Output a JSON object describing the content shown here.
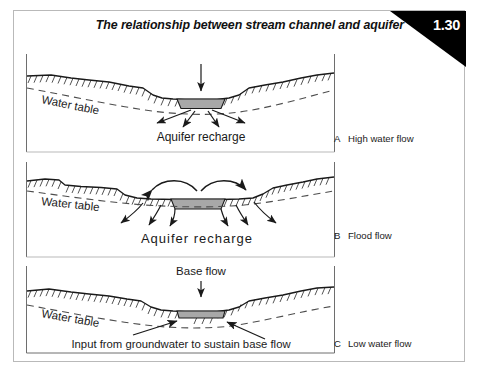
{
  "figure": {
    "title": "The relationship between stream channel and aquifer",
    "number": "1.30"
  },
  "panels": [
    {
      "id": "A",
      "legend_letter": "A",
      "legend_text": "High water flow",
      "labels": {
        "water_table": "Water table",
        "recharge": "Aquifer recharge"
      }
    },
    {
      "id": "B",
      "legend_letter": "B",
      "legend_text": "Flood flow",
      "labels": {
        "water_table": "Water table",
        "recharge": "Aquifer recharge"
      }
    },
    {
      "id": "C",
      "legend_letter": "C",
      "legend_text": "Low water flow",
      "labels": {
        "water_table": "Water table",
        "base_flow": "Base flow",
        "groundwater_input": "Input from groundwater to sustain base flow"
      }
    }
  ],
  "colors": {
    "channel_water": "#a8a8a8",
    "ground_line": "#1a1a1a",
    "water_table_line": "#4d4d4d",
    "frame": "#b9b9b9",
    "corner": "#000000",
    "corner_text": "#ffffff"
  }
}
